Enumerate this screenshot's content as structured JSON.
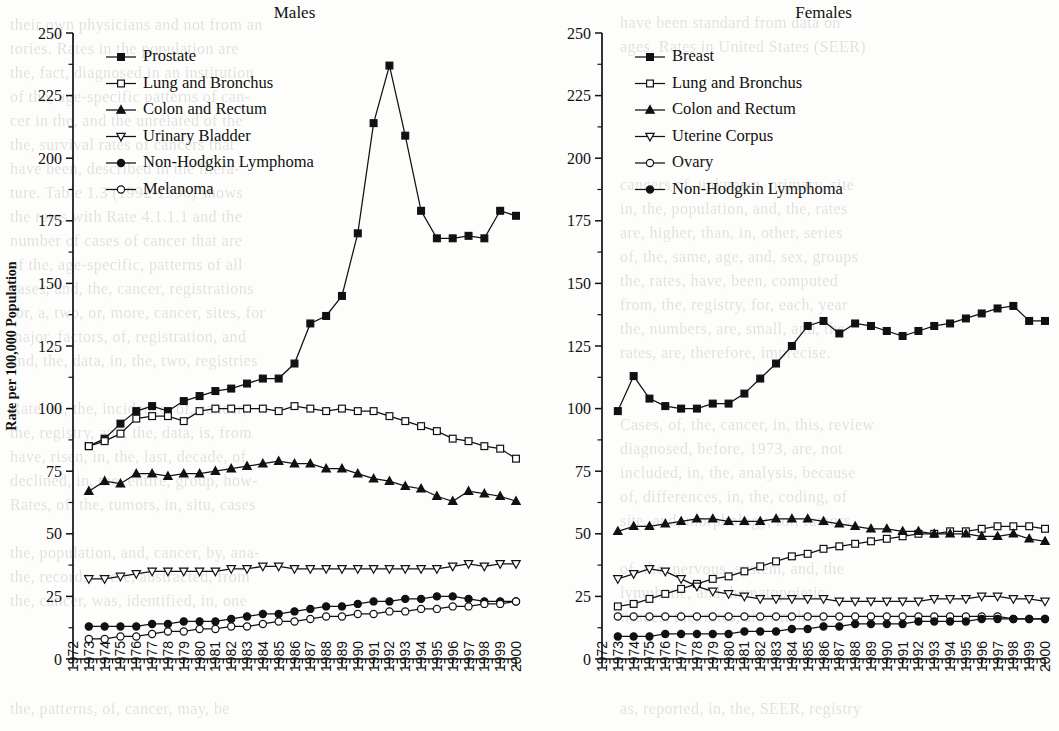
{
  "figure": {
    "axis_label_x": "Year of diagnosis",
    "axis_label_y": "Rate per 100,000 Population"
  },
  "panels": [
    {
      "id": "males",
      "title": "Males"
    },
    {
      "id": "females",
      "title": "Females"
    }
  ],
  "bleed_text": [
    {
      "x": 10,
      "y": 16,
      "t": "their own physicians and not from an"
    },
    {
      "x": 620,
      "y": 14,
      "t": "have been standard from data on"
    },
    {
      "x": 10,
      "y": 40,
      "t": "tories. Rates in the population are"
    },
    {
      "x": 620,
      "y": 38,
      "t": "ages. Rates in United States (SEER)"
    },
    {
      "x": 10,
      "y": 64,
      "t": "the, fact, diagnosed in an institution"
    },
    {
      "x": 10,
      "y": 88,
      "t": "of the, age-specific patterns of can-"
    },
    {
      "x": 10,
      "y": 112,
      "t": "cer in the, and the unrelated of the"
    },
    {
      "x": 10,
      "y": 136,
      "t": "the, survival rates of cancers that"
    },
    {
      "x": 10,
      "y": 160,
      "t": "have been, described in the litera-"
    },
    {
      "x": 10,
      "y": 184,
      "t": "ture. Table 1.3 (1992-1996) shows"
    },
    {
      "x": 10,
      "y": 208,
      "t": "the rates with Rate 4.1.1.1 and the"
    },
    {
      "x": 10,
      "y": 232,
      "t": "number of cases of cancer that are"
    },
    {
      "x": 10,
      "y": 256,
      "t": "of the, age-specific, patterns of all"
    },
    {
      "x": 10,
      "y": 280,
      "t": "cases, and, the, cancer, registrations"
    },
    {
      "x": 10,
      "y": 304,
      "t": "for, a, two, or, more, cancer, sites, for"
    },
    {
      "x": 10,
      "y": 328,
      "t": "major, factors, of, registration, and"
    },
    {
      "x": 10,
      "y": 352,
      "t": "and, the, data, in, the, two, registries"
    },
    {
      "x": 10,
      "y": 400,
      "t": "Rate, of, the, incidence, of, cancer,"
    },
    {
      "x": 10,
      "y": 424,
      "t": "the, registry, and, the, data, is, from"
    },
    {
      "x": 10,
      "y": 448,
      "t": "have, risen, in, the, last, decade, of"
    },
    {
      "x": 10,
      "y": 472,
      "t": "declined, in, the, entire, group, how-"
    },
    {
      "x": 10,
      "y": 496,
      "t": "Rates, of, the, tumors, in, situ, cases"
    },
    {
      "x": 10,
      "y": 544,
      "t": "the, population, and, cancer, by, ana-"
    },
    {
      "x": 10,
      "y": 568,
      "t": "the, records, were, abstracted, from"
    },
    {
      "x": 10,
      "y": 592,
      "t": "the, cancer, was, identified, in, one"
    },
    {
      "x": 620,
      "y": 176,
      "t": "cancers of, unknown, primary, site"
    },
    {
      "x": 620,
      "y": 200,
      "t": "in, the, population, and, the, rates"
    },
    {
      "x": 620,
      "y": 224,
      "t": "are, higher, than, in, other, series"
    },
    {
      "x": 620,
      "y": 248,
      "t": "of, the, same, age, and, sex, groups"
    },
    {
      "x": 620,
      "y": 272,
      "t": "the, rates, have, been, computed"
    },
    {
      "x": 620,
      "y": 296,
      "t": "from, the, registry, for, each, year"
    },
    {
      "x": 620,
      "y": 320,
      "t": "the, numbers, are, small, and, the"
    },
    {
      "x": 620,
      "y": 344,
      "t": "rates, are, therefore, imprecise."
    },
    {
      "x": 620,
      "y": 416,
      "t": "Cases, of, the, cancer, in, this, review"
    },
    {
      "x": 620,
      "y": 440,
      "t": "diagnosed, before, 1973, are, not"
    },
    {
      "x": 620,
      "y": 464,
      "t": "included, in, the, analysis, because"
    },
    {
      "x": 620,
      "y": 488,
      "t": "of, differences, in, the, coding, of"
    },
    {
      "x": 620,
      "y": 512,
      "t": "site, and, morphology, for, tumors"
    },
    {
      "x": 620,
      "y": 560,
      "t": "of, the, nervous, system, and, the"
    },
    {
      "x": 620,
      "y": 584,
      "t": "lymphatic, and, hematopoietic"
    },
    {
      "x": 620,
      "y": 608,
      "t": "tissues, the, rates, shown, here"
    },
    {
      "x": 10,
      "y": 700,
      "t": "the, patterns, of, cancer, may, be"
    },
    {
      "x": 620,
      "y": 700,
      "t": "as, reported, in, the, SEER, registry"
    }
  ],
  "chart_data": [
    {
      "type": "line",
      "title": "Males",
      "xlabel": "Year of diagnosis",
      "ylabel": "Rate per 100,000 Population",
      "xlim": [
        1972,
        2000
      ],
      "ylim": [
        0,
        250
      ],
      "ytickstep": 25,
      "yticks": [
        0,
        25,
        50,
        75,
        100,
        125,
        150,
        175,
        200,
        225,
        250
      ],
      "grid": false,
      "legend_position": "top-left",
      "x": [
        1973,
        1974,
        1975,
        1976,
        1977,
        1978,
        1979,
        1980,
        1981,
        1982,
        1983,
        1984,
        1985,
        1986,
        1987,
        1988,
        1989,
        1990,
        1991,
        1992,
        1993,
        1994,
        1995,
        1996,
        1997,
        1998,
        1999,
        2000
      ],
      "xticklabels": [
        "1972",
        "1973",
        "1974",
        "1975",
        "1976",
        "1977",
        "1978",
        "1979",
        "1980",
        "1981",
        "1982",
        "1983",
        "1984",
        "1985",
        "1986",
        "1987",
        "1988",
        "1989",
        "1990",
        "1991",
        "1992",
        "1993",
        "1994",
        "1995",
        "1996",
        "1997",
        "1998",
        "1999",
        "2000"
      ],
      "series": [
        {
          "name": "Prostate",
          "marker": "square-filled",
          "values": [
            85,
            88,
            94,
            99,
            101,
            99,
            103,
            105,
            107,
            108,
            110,
            112,
            112,
            118,
            134,
            137,
            145,
            170,
            214,
            237,
            209,
            179,
            168,
            168,
            169,
            168,
            179,
            177
          ]
        },
        {
          "name": "Lung and Bronchus",
          "marker": "square-open",
          "values": [
            85,
            87,
            90,
            96,
            97,
            97,
            95,
            99,
            100,
            100,
            100,
            100,
            99,
            101,
            100,
            99,
            100,
            99,
            99,
            97,
            95,
            93,
            91,
            88,
            87,
            85,
            84,
            80
          ]
        },
        {
          "name": "Colon and Rectum",
          "marker": "triangle-up-filled",
          "values": [
            67,
            71,
            70,
            74,
            74,
            73,
            74,
            74,
            75,
            76,
            77,
            78,
            79,
            78,
            78,
            76,
            76,
            74,
            72,
            71,
            69,
            68,
            65,
            63,
            67,
            66,
            65,
            63
          ]
        },
        {
          "name": "Urinary Bladder",
          "marker": "triangle-down-open",
          "values": [
            32,
            32,
            33,
            34,
            35,
            35,
            35,
            35,
            35,
            36,
            36,
            37,
            37,
            36,
            36,
            36,
            36,
            36,
            36,
            36,
            36,
            36,
            36,
            37,
            38,
            37,
            38,
            38
          ]
        },
        {
          "name": "Non-Hodgkin Lymphoma",
          "marker": "circle-filled",
          "values": [
            13,
            13,
            13,
            13,
            14,
            14,
            15,
            15,
            15,
            16,
            17,
            18,
            18,
            19,
            20,
            21,
            21,
            22,
            23,
            23,
            24,
            24,
            25,
            25,
            24,
            23,
            23,
            23
          ]
        },
        {
          "name": "Melanoma",
          "marker": "circle-open",
          "values": [
            8,
            8,
            9,
            9,
            10,
            11,
            11,
            12,
            12,
            13,
            13,
            14,
            15,
            15,
            16,
            17,
            17,
            18,
            18,
            19,
            19,
            20,
            20,
            21,
            21,
            22,
            22,
            23
          ]
        }
      ]
    },
    {
      "type": "line",
      "title": "Females",
      "xlabel": "Year of diagnosis",
      "ylabel": "Rate per 100,000 Population",
      "xlim": [
        1972,
        2000
      ],
      "ylim": [
        0,
        250
      ],
      "ytickstep": 25,
      "yticks": [
        0,
        25,
        50,
        75,
        100,
        125,
        150,
        175,
        200,
        225,
        250
      ],
      "grid": false,
      "legend_position": "top-left",
      "x": [
        1973,
        1974,
        1975,
        1976,
        1977,
        1978,
        1979,
        1980,
        1981,
        1982,
        1983,
        1984,
        1985,
        1986,
        1987,
        1988,
        1989,
        1990,
        1991,
        1992,
        1993,
        1994,
        1995,
        1996,
        1997,
        1998,
        1999,
        2000
      ],
      "xticklabels": [
        "1972",
        "1973",
        "1974",
        "1975",
        "1976",
        "1977",
        "1978",
        "1979",
        "1980",
        "1981",
        "1982",
        "1983",
        "1984",
        "1985",
        "1986",
        "1987",
        "1988",
        "1989",
        "1990",
        "1991",
        "1992",
        "1993",
        "1994",
        "1995",
        "1996",
        "1997",
        "1998",
        "1999",
        "2000"
      ],
      "series": [
        {
          "name": "Breast",
          "marker": "square-filled",
          "values": [
            99,
            113,
            104,
            101,
            100,
            100,
            102,
            102,
            106,
            112,
            118,
            125,
            133,
            135,
            130,
            134,
            133,
            131,
            129,
            131,
            133,
            134,
            136,
            138,
            140,
            141,
            135,
            135
          ]
        },
        {
          "name": "Lung and Bronchus",
          "marker": "square-open",
          "values": [
            21,
            22,
            24,
            26,
            28,
            30,
            32,
            33,
            35,
            37,
            39,
            41,
            42,
            44,
            45,
            46,
            47,
            48,
            49,
            50,
            50,
            51,
            51,
            52,
            53,
            53,
            53,
            52
          ]
        },
        {
          "name": "Colon and Rectum",
          "marker": "triangle-up-filled",
          "values": [
            51,
            53,
            53,
            54,
            55,
            56,
            56,
            55,
            55,
            55,
            56,
            56,
            56,
            55,
            54,
            53,
            52,
            52,
            51,
            51,
            50,
            50,
            50,
            49,
            49,
            50,
            48,
            47
          ]
        },
        {
          "name": "Uterine Corpus",
          "marker": "triangle-down-open",
          "values": [
            32,
            34,
            36,
            35,
            32,
            29,
            27,
            26,
            25,
            24,
            24,
            24,
            24,
            24,
            23,
            23,
            23,
            23,
            23,
            23,
            24,
            24,
            24,
            25,
            25,
            24,
            24,
            23
          ]
        },
        {
          "name": "Ovary",
          "marker": "circle-open",
          "values": [
            17,
            17,
            17,
            17,
            17,
            17,
            17,
            17,
            17,
            17,
            17,
            17,
            17,
            17,
            17,
            17,
            17,
            17,
            17,
            17,
            17,
            17,
            17,
            17,
            17,
            16,
            16,
            16
          ]
        },
        {
          "name": "Non-Hodgkin Lymphoma",
          "marker": "circle-filled",
          "values": [
            9,
            9,
            9,
            10,
            10,
            10,
            10,
            10,
            11,
            11,
            11,
            12,
            12,
            13,
            13,
            14,
            14,
            14,
            14,
            15,
            15,
            15,
            15,
            16,
            16,
            16,
            16,
            16
          ]
        }
      ]
    }
  ]
}
